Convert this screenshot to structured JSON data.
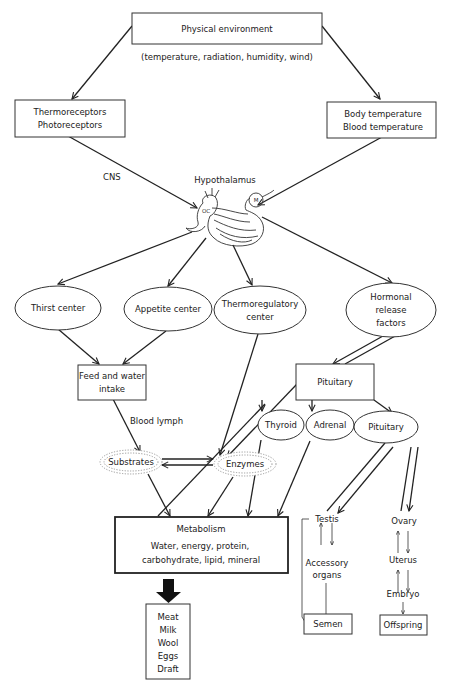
{
  "diagram": {
    "nodes": {
      "physical_environment": {
        "label": "Physical environment",
        "caption": "(temperature, radiation, humidity, wind)"
      },
      "receptors": {
        "line1": "Thermoreceptors",
        "line2": "Photoreceptors"
      },
      "body_temp": {
        "line1": "Body temperature",
        "line2": "Blood temperature"
      },
      "hypothalamus": {
        "label": "Hypothalamus",
        "oc": "OC",
        "m": "M"
      },
      "thirst": {
        "label": "Thirst center"
      },
      "appetite": {
        "label": "Appetite center"
      },
      "thermoreg": {
        "line1": "Thermoregulatory",
        "line2": "center"
      },
      "hormonal": {
        "line1": "Hormonal",
        "line2": "release",
        "line3": "factors"
      },
      "feed": {
        "line1": "Feed and water",
        "line2": "intake"
      },
      "pituitary_box": {
        "label": "Pituitary"
      },
      "thyroid": {
        "label": "Thyroid"
      },
      "adrenal": {
        "label": "Adrenal"
      },
      "pituitary_ell": {
        "label": "Pituitary"
      },
      "substrates": {
        "label": "Substrates"
      },
      "enzymes": {
        "label": "Enzymes"
      },
      "metabolism": {
        "title": "Metabolism",
        "line1": "Water, energy, protein,",
        "line2": "carbohydrate, lipid, mineral"
      },
      "products": {
        "items": [
          "Meat",
          "Milk",
          "Wool",
          "Eggs",
          "Draft"
        ]
      },
      "testis": {
        "label": "Testis"
      },
      "accessory": {
        "line1": "Accessory",
        "line2": "organs"
      },
      "semen": {
        "label": "Semen"
      },
      "ovary": {
        "label": "Ovary"
      },
      "uterus": {
        "label": "Uterus"
      },
      "embryo": {
        "label": "Embryo"
      },
      "offspring": {
        "label": "Offspring"
      }
    },
    "edge_labels": {
      "cns": "CNS",
      "blood_lymph": "Blood lymph"
    },
    "colors": {
      "stroke": "#222222",
      "background": "#ffffff",
      "cloud": "#999999"
    }
  }
}
